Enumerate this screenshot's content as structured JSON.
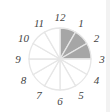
{
  "diagram": {
    "type": "clock-fraction-circle",
    "segments": 12,
    "shaded_segments": [
      1,
      2,
      3
    ],
    "labels": [
      "12",
      "1",
      "2",
      "3",
      "4",
      "5",
      "6",
      "7",
      "8",
      "9",
      "10",
      "11"
    ],
    "colors": {
      "shaded": "#a6a6a6",
      "stroke": "#e6e6e6",
      "background": "#ffffff",
      "label": "#444444"
    }
  }
}
